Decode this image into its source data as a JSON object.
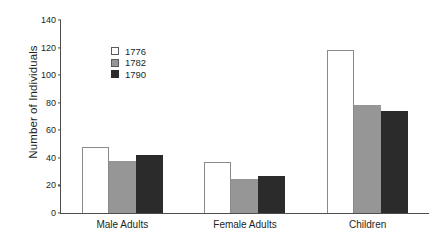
{
  "chart_data": {
    "type": "bar",
    "title": "",
    "xlabel": "",
    "ylabel": "Number of Individuals",
    "categories": [
      "Male Adults",
      "Female Adults",
      "Children"
    ],
    "series": [
      {
        "name": "1776",
        "color": "#ffffff",
        "values": [
          48,
          37,
          118
        ]
      },
      {
        "name": "1782",
        "color": "#969696",
        "values": [
          38,
          25,
          78
        ]
      },
      {
        "name": "1790",
        "color": "#2b2b2b",
        "values": [
          42,
          27,
          74
        ]
      }
    ],
    "ylim": [
      0,
      140
    ],
    "yticks": [
      0,
      20,
      40,
      60,
      80,
      100,
      120,
      140
    ],
    "ytick_labels": [
      "0",
      "20",
      "40",
      "60",
      "80",
      "100",
      "120",
      "140"
    ],
    "grid": false,
    "legend_position": "upper-left-inside"
  }
}
